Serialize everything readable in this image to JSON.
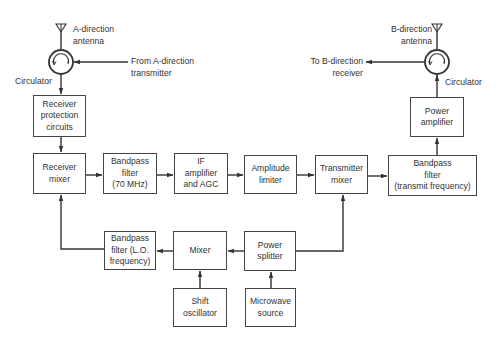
{
  "diagram": {
    "type": "block-diagram",
    "labels": {
      "a_antenna": "A-direction\nantenna",
      "a_from_tx": "From A-direction\ntransmitter",
      "a_circulator": "Circulator",
      "b_antenna": "B-direction\nantenna",
      "b_to_rx": "To B-direction\nreceiver",
      "b_circulator": "Circulator"
    },
    "blocks": {
      "receiver_protection": "Receiver\nprotection\ncircuits",
      "receiver_mixer": "Receiver\nmixer",
      "bandpass_70": "Bandpass\nfilter\n(70 MHz)",
      "if_amp": "IF\namplifier\nand AGC",
      "amp_limiter": "Amplitude\nlimiter",
      "tx_mixer": "Transmitter\nmixer",
      "bandpass_tx": "Bandpass\nfilter\n(transmit frequency)",
      "power_amp": "Power\namplifier",
      "bandpass_lo": "Bandpass\nfilter (L.O.\nfrequency)",
      "mixer": "Mixer",
      "power_splitter": "Power\nsplitter",
      "shift_osc": "Shift\noscillator",
      "microwave_source": "Microwave\nsource"
    },
    "connections": [
      [
        "A-direction antenna",
        "Circulator (A)"
      ],
      [
        "From A-direction transmitter",
        "Circulator (A)"
      ],
      [
        "Circulator (A)",
        "Receiver protection circuits"
      ],
      [
        "Receiver protection circuits",
        "Receiver mixer"
      ],
      [
        "Receiver mixer",
        "Bandpass filter (70 MHz)"
      ],
      [
        "Bandpass filter (70 MHz)",
        "IF amplifier and AGC"
      ],
      [
        "IF amplifier and AGC",
        "Amplitude limiter"
      ],
      [
        "Amplitude limiter",
        "Transmitter mixer"
      ],
      [
        "Transmitter mixer",
        "Bandpass filter (transmit frequency)"
      ],
      [
        "Bandpass filter (transmit frequency)",
        "Power amplifier"
      ],
      [
        "Power amplifier",
        "Circulator (B)"
      ],
      [
        "Circulator (B)",
        "B-direction antenna"
      ],
      [
        "Circulator (B)",
        "To B-direction receiver"
      ],
      [
        "Microwave source",
        "Power splitter"
      ],
      [
        "Power splitter",
        "Transmitter mixer"
      ],
      [
        "Power splitter",
        "Mixer"
      ],
      [
        "Shift oscillator",
        "Mixer"
      ],
      [
        "Mixer",
        "Bandpass filter (L.O. frequency)"
      ],
      [
        "Bandpass filter (L.O. frequency)",
        "Receiver mixer"
      ]
    ]
  }
}
